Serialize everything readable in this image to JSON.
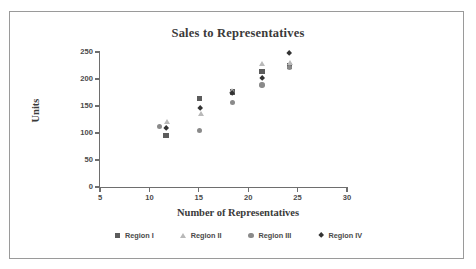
{
  "chart_data": {
    "type": "scatter",
    "title": "Sales to Representatives",
    "xlabel": "Number of Representatives",
    "ylabel": "Units",
    "xlim": [
      5,
      30
    ],
    "ylim": [
      0,
      250
    ],
    "xticks": [
      5,
      10,
      15,
      20,
      25,
      30
    ],
    "yticks": [
      0,
      50,
      100,
      150,
      200,
      250
    ],
    "grid": false,
    "legend_position": "bottom",
    "series": [
      {
        "name": "Region I",
        "marker": "square",
        "color": "#5c5c5c",
        "points": [
          {
            "x": 11.7,
            "y": 95
          },
          {
            "x": 15.1,
            "y": 164
          },
          {
            "x": 18.4,
            "y": 176
          },
          {
            "x": 21.4,
            "y": 214
          },
          {
            "x": 24.2,
            "y": 224
          }
        ]
      },
      {
        "name": "Region II",
        "marker": "triangle",
        "color": "#b9b9b9",
        "points": [
          {
            "x": 11.8,
            "y": 121
          },
          {
            "x": 15.2,
            "y": 136
          },
          {
            "x": 18.4,
            "y": 179
          },
          {
            "x": 21.4,
            "y": 229
          },
          {
            "x": 24.2,
            "y": 231
          }
        ]
      },
      {
        "name": "Region III",
        "marker": "circle",
        "color": "#8a8a8a",
        "points": [
          {
            "x": 11.0,
            "y": 112
          },
          {
            "x": 15.1,
            "y": 105
          },
          {
            "x": 18.4,
            "y": 156
          },
          {
            "x": 21.4,
            "y": 189
          },
          {
            "x": 24.2,
            "y": 221
          }
        ]
      },
      {
        "name": "Region IV",
        "marker": "diamond",
        "color": "#333333",
        "points": [
          {
            "x": 11.7,
            "y": 108
          },
          {
            "x": 15.1,
            "y": 145
          },
          {
            "x": 18.4,
            "y": 174
          },
          {
            "x": 21.4,
            "y": 201
          },
          {
            "x": 24.2,
            "y": 247
          }
        ]
      }
    ]
  }
}
